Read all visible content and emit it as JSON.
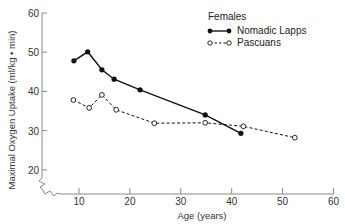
{
  "chart_data": {
    "type": "line",
    "title": "",
    "xlabel": "Age (years)",
    "ylabel": "Maximal Oxygen Uptake (ml/kg • min)",
    "xlim": [
      0,
      60
    ],
    "ylim": [
      15,
      60
    ],
    "x_ticks": [
      10,
      20,
      30,
      40,
      50,
      60
    ],
    "y_ticks": [
      20,
      30,
      40,
      50,
      60
    ],
    "grid": false,
    "axis_break": true,
    "legend": {
      "title": "Females",
      "position": "top-right",
      "entries": [
        "Nomadic Lapps",
        "Pascuans"
      ]
    },
    "series": [
      {
        "name": "Nomadic Lapps",
        "style": "solid",
        "marker": "filled-circle",
        "x": [
          9,
          11.7,
          14.5,
          16.9,
          22,
          34.8,
          41.8
        ],
        "y": [
          47.8,
          50.1,
          45.5,
          43.1,
          40.4,
          34.0,
          29.3
        ]
      },
      {
        "name": "Pascuans",
        "style": "dashed",
        "marker": "open-circle",
        "x": [
          8.9,
          12.0,
          14.5,
          17.3,
          24.8,
          34.8,
          42.3,
          52.4
        ],
        "y": [
          37.8,
          35.8,
          39.1,
          35.3,
          31.9,
          32.0,
          31.1,
          28.2
        ]
      }
    ]
  },
  "colors": {
    "axis": "#888888",
    "series_line": "#111111",
    "text": "#333333"
  }
}
